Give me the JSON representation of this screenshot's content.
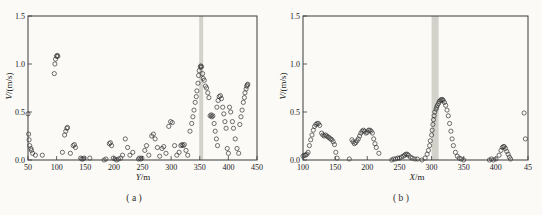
{
  "figure": {
    "background_color": "#fbfaf7",
    "band_color": "#d2d2cb",
    "marker_color": "#2e2e2e",
    "axis_color": "#3a3a3a"
  },
  "chart_data": [
    {
      "id": "a",
      "type": "scatter",
      "caption": "( a )",
      "xlabel_var": "Y",
      "xlabel_unit": "/m",
      "ylabel_var": "V",
      "ylabel_unit": "/(m/s)",
      "xlim": [
        50,
        450
      ],
      "ylim": [
        0,
        1.5
      ],
      "x_ticks": [
        50,
        100,
        150,
        200,
        250,
        300,
        350,
        400,
        450
      ],
      "x_tick_labels": [
        "50",
        "100",
        "150",
        "200",
        "250",
        "300",
        "350",
        "400",
        "450"
      ],
      "y_ticks": [
        0,
        0.5,
        1.0,
        1.5
      ],
      "y_tick_labels": [
        "0.0",
        "0.5",
        "1.0",
        "1.5"
      ],
      "grid": false,
      "legend": null,
      "marker": "open-circle",
      "highlight_band_x": [
        349,
        356
      ],
      "points": [
        [
          50,
          0.48
        ],
        [
          51,
          0.27
        ],
        [
          52,
          0.21
        ],
        [
          53,
          0.15
        ],
        [
          55,
          0.12
        ],
        [
          56,
          0.1
        ],
        [
          58,
          0.07
        ],
        [
          63,
          0.05
        ],
        [
          75,
          0.05
        ],
        [
          96,
          0.9
        ],
        [
          97,
          1.0
        ],
        [
          98,
          1.05
        ],
        [
          100,
          1.08
        ],
        [
          101,
          1.09
        ],
        [
          102,
          1.08
        ],
        [
          110,
          0.08
        ],
        [
          114,
          0.26
        ],
        [
          116,
          0.3
        ],
        [
          118,
          0.33
        ],
        [
          119,
          0.34
        ],
        [
          124,
          0.07
        ],
        [
          129,
          0.15
        ],
        [
          131,
          0.16
        ],
        [
          133,
          0.13
        ],
        [
          142,
          0.02
        ],
        [
          144,
          0.01
        ],
        [
          146,
          0.01
        ],
        [
          148,
          0.02
        ],
        [
          158,
          0.02
        ],
        [
          183,
          0.0
        ],
        [
          186,
          0.01
        ],
        [
          192,
          0.17
        ],
        [
          194,
          0.18
        ],
        [
          196,
          0.15
        ],
        [
          199,
          0.02
        ],
        [
          202,
          0.01
        ],
        [
          205,
          0.0
        ],
        [
          208,
          0.01
        ],
        [
          212,
          0.02
        ],
        [
          215,
          0.05
        ],
        [
          220,
          0.22
        ],
        [
          224,
          0.13
        ],
        [
          228,
          0.05
        ],
        [
          233,
          0.08
        ],
        [
          243,
          0.01
        ],
        [
          245,
          0.02
        ],
        [
          247,
          0.01
        ],
        [
          249,
          0.02
        ],
        [
          254,
          0.1
        ],
        [
          257,
          0.15
        ],
        [
          261,
          0.05
        ],
        [
          266,
          0.25
        ],
        [
          269,
          0.27
        ],
        [
          272,
          0.22
        ],
        [
          276,
          0.13
        ],
        [
          280,
          0.04
        ],
        [
          284,
          0.12
        ],
        [
          287,
          0.14
        ],
        [
          291,
          0.07
        ],
        [
          296,
          0.35
        ],
        [
          299,
          0.4
        ],
        [
          302,
          0.39
        ],
        [
          306,
          0.15
        ],
        [
          310,
          0.05
        ],
        [
          314,
          0.08
        ],
        [
          317,
          0.15
        ],
        [
          319,
          0.16
        ],
        [
          321,
          0.15
        ],
        [
          323,
          0.16
        ],
        [
          326,
          0.1
        ],
        [
          329,
          0.05
        ],
        [
          333,
          0.3
        ],
        [
          336,
          0.38
        ],
        [
          338,
          0.45
        ],
        [
          340,
          0.52
        ],
        [
          342,
          0.6
        ],
        [
          344,
          0.66
        ],
        [
          345,
          0.72
        ],
        [
          347,
          0.8
        ],
        [
          348,
          0.88
        ],
        [
          349,
          0.93
        ],
        [
          351,
          0.97
        ],
        [
          352,
          0.98
        ],
        [
          353,
          0.97
        ],
        [
          355,
          0.9
        ],
        [
          356,
          0.85
        ],
        [
          358,
          0.83
        ],
        [
          360,
          0.77
        ],
        [
          362,
          0.75
        ],
        [
          364,
          0.7
        ],
        [
          366,
          0.65
        ],
        [
          368,
          0.46
        ],
        [
          370,
          0.47
        ],
        [
          371,
          0.45
        ],
        [
          373,
          0.46
        ],
        [
          375,
          0.38
        ],
        [
          377,
          0.3
        ],
        [
          379,
          0.22
        ],
        [
          381,
          0.15
        ],
        [
          380,
          0.55
        ],
        [
          382,
          0.62
        ],
        [
          384,
          0.66
        ],
        [
          386,
          0.67
        ],
        [
          388,
          0.64
        ],
        [
          390,
          0.55
        ],
        [
          392,
          0.48
        ],
        [
          394,
          0.4
        ],
        [
          396,
          0.33
        ],
        [
          398,
          0.12
        ],
        [
          400,
          0.07
        ],
        [
          402,
          0.55
        ],
        [
          404,
          0.5
        ],
        [
          407,
          0.4
        ],
        [
          409,
          0.33
        ],
        [
          412,
          0.22
        ],
        [
          415,
          0.12
        ],
        [
          418,
          0.07
        ],
        [
          420,
          0.37
        ],
        [
          422,
          0.45
        ],
        [
          424,
          0.52
        ],
        [
          426,
          0.6
        ],
        [
          428,
          0.65
        ],
        [
          429,
          0.7
        ],
        [
          431,
          0.74
        ],
        [
          432,
          0.77
        ],
        [
          433,
          0.78
        ],
        [
          434,
          0.79
        ]
      ]
    },
    {
      "id": "b",
      "type": "scatter",
      "caption": "( b )",
      "xlabel_var": "X",
      "xlabel_unit": "/m",
      "ylabel_var": "V",
      "ylabel_unit": "/(m/s)",
      "xlim": [
        100,
        450
      ],
      "ylim": [
        0,
        1.5
      ],
      "x_ticks": [
        100,
        150,
        200,
        250,
        300,
        350,
        400,
        450
      ],
      "x_tick_labels": [
        "100",
        "150",
        "200",
        "250",
        "300",
        "350",
        "400",
        "45"
      ],
      "y_ticks": [
        0,
        0.5,
        1.0,
        1.5
      ],
      "y_tick_labels": [
        "0.0",
        "0.5",
        "1.0",
        "1.5"
      ],
      "grid": false,
      "legend": null,
      "marker": "open-circle",
      "highlight_band_x": [
        300,
        311
      ],
      "points": [
        [
          100,
          0.04
        ],
        [
          102,
          0.05
        ],
        [
          104,
          0.05
        ],
        [
          106,
          0.06
        ],
        [
          108,
          0.08
        ],
        [
          110,
          0.15
        ],
        [
          112,
          0.21
        ],
        [
          114,
          0.26
        ],
        [
          116,
          0.31
        ],
        [
          118,
          0.35
        ],
        [
          120,
          0.37
        ],
        [
          122,
          0.38
        ],
        [
          124,
          0.38
        ],
        [
          126,
          0.36
        ],
        [
          129,
          0.28
        ],
        [
          131,
          0.26
        ],
        [
          133,
          0.25
        ],
        [
          135,
          0.26
        ],
        [
          137,
          0.25
        ],
        [
          139,
          0.24
        ],
        [
          141,
          0.23
        ],
        [
          143,
          0.22
        ],
        [
          145,
          0.21
        ],
        [
          147,
          0.19
        ],
        [
          149,
          0.16
        ],
        [
          151,
          0.08
        ],
        [
          153,
          0.02
        ],
        [
          172,
          0.01
        ],
        [
          176,
          0.21
        ],
        [
          178,
          0.19
        ],
        [
          180,
          0.17
        ],
        [
          182,
          0.18
        ],
        [
          184,
          0.2
        ],
        [
          186,
          0.22
        ],
        [
          188,
          0.25
        ],
        [
          190,
          0.28
        ],
        [
          192,
          0.3
        ],
        [
          194,
          0.31
        ],
        [
          196,
          0.3
        ],
        [
          198,
          0.28
        ],
        [
          200,
          0.29
        ],
        [
          202,
          0.31
        ],
        [
          204,
          0.31
        ],
        [
          206,
          0.3
        ],
        [
          208,
          0.28
        ],
        [
          210,
          0.22
        ],
        [
          212,
          0.17
        ],
        [
          214,
          0.13
        ],
        [
          218,
          0.07
        ],
        [
          238,
          0.0
        ],
        [
          241,
          0.01
        ],
        [
          244,
          0.01
        ],
        [
          247,
          0.02
        ],
        [
          250,
          0.02
        ],
        [
          253,
          0.03
        ],
        [
          256,
          0.04
        ],
        [
          258,
          0.05
        ],
        [
          260,
          0.06
        ],
        [
          262,
          0.06
        ],
        [
          264,
          0.05
        ],
        [
          267,
          0.03
        ],
        [
          270,
          0.02
        ],
        [
          274,
          0.01
        ],
        [
          278,
          0.01
        ],
        [
          285,
          0.0
        ],
        [
          290,
          0.02
        ],
        [
          293,
          0.06
        ],
        [
          295,
          0.1
        ],
        [
          297,
          0.15
        ],
        [
          298,
          0.2
        ],
        [
          300,
          0.26
        ],
        [
          301,
          0.31
        ],
        [
          302,
          0.37
        ],
        [
          303,
          0.42
        ],
        [
          304,
          0.46
        ],
        [
          305,
          0.5
        ],
        [
          307,
          0.53
        ],
        [
          308,
          0.55
        ],
        [
          309,
          0.57
        ],
        [
          311,
          0.59
        ],
        [
          312,
          0.61
        ],
        [
          314,
          0.62
        ],
        [
          315,
          0.63
        ],
        [
          317,
          0.63
        ],
        [
          318,
          0.62
        ],
        [
          320,
          0.6
        ],
        [
          322,
          0.57
        ],
        [
          324,
          0.52
        ],
        [
          326,
          0.46
        ],
        [
          328,
          0.38
        ],
        [
          330,
          0.3
        ],
        [
          332,
          0.22
        ],
        [
          334,
          0.15
        ],
        [
          337,
          0.08
        ],
        [
          340,
          0.04
        ],
        [
          343,
          0.02
        ],
        [
          346,
          0.01
        ],
        [
          350,
          0.0
        ],
        [
          390,
          0.0
        ],
        [
          393,
          0.01
        ],
        [
          396,
          0.0
        ],
        [
          400,
          0.01
        ],
        [
          405,
          0.05
        ],
        [
          408,
          0.1
        ],
        [
          410,
          0.13
        ],
        [
          412,
          0.14
        ],
        [
          413,
          0.14
        ],
        [
          415,
          0.12
        ],
        [
          417,
          0.09
        ],
        [
          419,
          0.06
        ],
        [
          421,
          0.03
        ],
        [
          423,
          0.01
        ],
        [
          444,
          0.49
        ],
        [
          446,
          0.22
        ]
      ]
    }
  ]
}
